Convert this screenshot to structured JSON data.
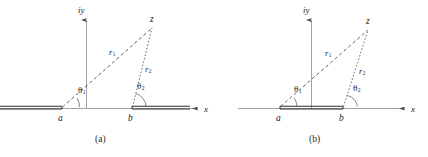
{
  "figure": {
    "background": "#ffffff",
    "ink_color": "#3a3a3a",
    "text_color": "#1a1a1a",
    "width": 428,
    "height": 157
  },
  "panels": [
    {
      "id": "a",
      "caption": "(a)",
      "caption_x": 101,
      "caption_y": 141,
      "description": "Branch cuts run from a to minus infinity and from b to plus infinity",
      "axes": {
        "origin_x": 86,
        "origin_y": 108,
        "y_axis_label": "iy",
        "y_axis_label_x": 80,
        "y_axis_label_y": 11,
        "y_axis_top": 14,
        "x_axis_label": "x",
        "x_axis_label_x": 205,
        "x_axis_label_y": 110,
        "x_axis_left": 0,
        "x_axis_right": 203
      },
      "points": [
        {
          "name": "a",
          "label": "a",
          "x": 62,
          "y": 108,
          "label_x": 59,
          "label_y": 118
        },
        {
          "name": "b",
          "label": "b",
          "x": 132,
          "y": 108,
          "label_x": 129,
          "label_y": 118
        },
        {
          "name": "z",
          "label": "z",
          "x": 152,
          "y": 27,
          "label_x": 151,
          "label_y": 20
        }
      ],
      "rays": [
        {
          "name": "r1",
          "label": "r",
          "subscript": "1",
          "style": "dashed",
          "from": "a",
          "to": "z",
          "label_x": 112,
          "label_y": 53
        },
        {
          "name": "r2",
          "label": "r",
          "subscript": "2",
          "style": "dotted",
          "from": "b",
          "to": "z",
          "label_x": 148,
          "label_y": 70
        }
      ],
      "angles": [
        {
          "name": "theta1",
          "label": "θ",
          "subscript": "1",
          "vertex": "a",
          "label_x": 81,
          "label_y": 92,
          "arc_radius": 16
        },
        {
          "name": "theta2",
          "label": "θ",
          "subscript": "2",
          "vertex": "b",
          "label_x": 140,
          "label_y": 88,
          "arc_radius": 14
        }
      ],
      "cuts": [
        {
          "name": "cut-left",
          "from_x": 0,
          "to_x": 62,
          "y": 108,
          "style": "double-line"
        },
        {
          "name": "cut-right",
          "from_x": 132,
          "to_x": 190,
          "y": 108,
          "style": "double-line"
        }
      ]
    },
    {
      "id": "b",
      "caption": "(b)",
      "caption_x": 315,
      "caption_y": 141,
      "description": "Branch cut is the finite segment joining a and b",
      "axes": {
        "origin_x": 311,
        "origin_y": 108,
        "y_axis_label": "iy",
        "y_axis_label_x": 305,
        "y_axis_label_y": 11,
        "y_axis_top": 14,
        "x_axis_label": "x",
        "x_axis_label_x": 412,
        "x_axis_label_y": 110,
        "x_axis_left": 238,
        "x_axis_right": 410
      },
      "points": [
        {
          "name": "a",
          "label": "a",
          "x": 280,
          "y": 108,
          "label_x": 277,
          "label_y": 118
        },
        {
          "name": "b",
          "label": "b",
          "x": 343,
          "y": 108,
          "label_x": 340,
          "label_y": 118
        },
        {
          "name": "z",
          "label": "z",
          "x": 368,
          "y": 29,
          "label_x": 367,
          "label_y": 22
        }
      ],
      "rays": [
        {
          "name": "r1",
          "label": "r",
          "subscript": "1",
          "style": "dashed",
          "from": "a",
          "to": "z",
          "label_x": 328,
          "label_y": 54
        },
        {
          "name": "r2",
          "label": "r",
          "subscript": "2",
          "style": "dotted",
          "from": "b",
          "to": "z",
          "label_x": 362,
          "label_y": 72
        }
      ],
      "angles": [
        {
          "name": "theta1",
          "label": "θ",
          "subscript": "1",
          "vertex": "a",
          "label_x": 297,
          "label_y": 91,
          "arc_radius": 16
        },
        {
          "name": "theta2",
          "label": "θ",
          "subscript": "2",
          "vertex": "b",
          "label_x": 356,
          "label_y": 90,
          "arc_radius": 14
        }
      ],
      "cuts": [
        {
          "name": "cut-middle",
          "from_x": 280,
          "to_x": 343,
          "y": 108,
          "style": "double-line"
        }
      ]
    }
  ]
}
